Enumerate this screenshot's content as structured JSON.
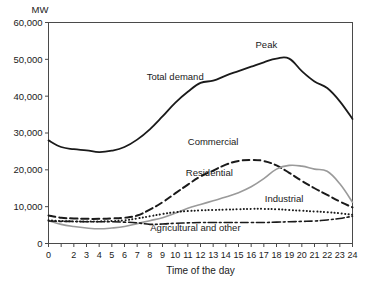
{
  "chart_data": {
    "type": "line",
    "title": "",
    "xlabel": "Time of the day",
    "ylabel": "MW",
    "unit_label": "MW",
    "xlim": [
      0,
      24
    ],
    "ylim": [
      0,
      60000
    ],
    "grid": false,
    "legend": "inline-annotations",
    "x": [
      0,
      1,
      2,
      3,
      4,
      5,
      6,
      7,
      8,
      9,
      10,
      11,
      12,
      13,
      14,
      15,
      16,
      17,
      18,
      19,
      20,
      21,
      22,
      23,
      24
    ],
    "xtick_labels": [
      "0",
      "2",
      "3",
      "4",
      "5",
      "6",
      "7",
      "8",
      "9",
      "10",
      "11",
      "12",
      "13",
      "14",
      "15",
      "16",
      "17",
      "18",
      "19",
      "20",
      "21",
      "22",
      "23",
      "24"
    ],
    "ytick_labels": [
      "0",
      "10,000",
      "20,000",
      "30,000",
      "40,000",
      "50,000",
      "60,000"
    ],
    "ytick_values": [
      0,
      10000,
      20000,
      30000,
      40000,
      50000,
      60000
    ],
    "series": [
      {
        "name": "Total demand",
        "label": "Total demand",
        "style": "solid",
        "color": "#1a1a1a",
        "width": 1.8,
        "label_x": 10.0,
        "label_y": 44500,
        "values": [
          28000,
          26200,
          25600,
          25300,
          24800,
          25200,
          26200,
          28200,
          31000,
          34500,
          38200,
          41200,
          43600,
          44200,
          45600,
          46800,
          48000,
          49200,
          50200,
          50200,
          46800,
          44000,
          42200,
          38600,
          33800
        ]
      },
      {
        "name": "Commercial",
        "label": "Commercial",
        "style": "dashed",
        "color": "#1a1a1a",
        "width": 2.0,
        "label_x": 13.0,
        "label_y": 26800,
        "values": [
          7600,
          7000,
          6800,
          6700,
          6700,
          6800,
          7000,
          7600,
          9200,
          11200,
          13600,
          16000,
          18200,
          19800,
          21400,
          22400,
          22700,
          22400,
          21200,
          19200,
          17000,
          15000,
          13200,
          11400,
          9800
        ]
      },
      {
        "name": "Residential",
        "label": "Residential",
        "style": "solid",
        "color": "#9a9a9a",
        "width": 1.6,
        "label_x": 12.7,
        "label_y": 18400,
        "values": [
          6200,
          5200,
          4600,
          4200,
          4000,
          4200,
          4600,
          5400,
          6200,
          7000,
          8200,
          9600,
          10600,
          11600,
          12600,
          13800,
          15400,
          17600,
          20200,
          21200,
          21000,
          20200,
          19600,
          16200,
          11200
        ]
      },
      {
        "name": "Industrial",
        "label": "Industrial",
        "style": "dotted",
        "color": "#1a1a1a",
        "width": 2.0,
        "label_x": 18.6,
        "label_y": 11400,
        "values": [
          6300,
          6100,
          6000,
          6000,
          6000,
          6100,
          6300,
          6800,
          7400,
          8000,
          8500,
          8800,
          9000,
          9100,
          9200,
          9300,
          9400,
          9400,
          9300,
          9100,
          8900,
          8700,
          8500,
          8200,
          7800
        ]
      },
      {
        "name": "Agricultural and other",
        "label": "Agricultural and other",
        "style": "dashdot",
        "color": "#1a1a1a",
        "width": 1.6,
        "label_x": 11.6,
        "label_y": 3300,
        "values": [
          6100,
          6000,
          6000,
          5900,
          5900,
          5900,
          5800,
          5600,
          5200,
          5300,
          5500,
          5600,
          5700,
          5700,
          5700,
          5700,
          5700,
          5700,
          5800,
          5900,
          6000,
          6100,
          6400,
          6800,
          7400
        ]
      }
    ],
    "annotations": [
      {
        "text": "Peak",
        "x": 17.2,
        "y": 53200
      }
    ]
  },
  "colors": {
    "axis": "#4a4a4a",
    "text": "#1a1a1a",
    "residential": "#9a9a9a",
    "background": "#ffffff"
  }
}
